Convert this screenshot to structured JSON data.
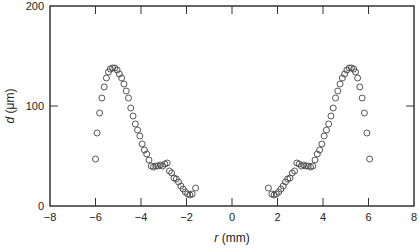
{
  "chart_data": {
    "type": "scatter",
    "title": "",
    "xlabel": "r (mm)",
    "ylabel": "d (μm)",
    "xlim": [
      -8,
      8
    ],
    "ylim": [
      0,
      200
    ],
    "xticks": [
      -8,
      -6,
      -4,
      -2,
      0,
      2,
      4,
      6,
      8
    ],
    "yticks": [
      0,
      100,
      200
    ],
    "xtick_labels": [
      "−8",
      "−6",
      "−4",
      "−2",
      "0",
      "2",
      "4",
      "6",
      "8"
    ],
    "ytick_labels": [
      "0",
      "100",
      "200"
    ],
    "grid": false,
    "legend": null,
    "marker": "open-circle",
    "series": [
      {
        "name": "left",
        "x": [
          -6.0,
          -5.93,
          -5.82,
          -5.72,
          -5.62,
          -5.52,
          -5.43,
          -5.35,
          -5.25,
          -5.15,
          -5.05,
          -4.95,
          -4.85,
          -4.75,
          -4.65,
          -4.55,
          -4.45,
          -4.35,
          -4.25,
          -4.15,
          -4.05,
          -3.95,
          -3.85,
          -3.75,
          -3.65,
          -3.55,
          -3.45,
          -3.35,
          -3.25,
          -3.15,
          -3.05,
          -2.95,
          -2.85,
          -2.75,
          -2.65,
          -2.55,
          -2.45,
          -2.35,
          -2.25,
          -2.15,
          -2.05,
          -1.95,
          -1.85,
          -1.75,
          -1.6
        ],
        "y": [
          47,
          73,
          93,
          108,
          119,
          128,
          134,
          137,
          138,
          138,
          136,
          132,
          128,
          122,
          115,
          108,
          98,
          90,
          82,
          76,
          70,
          62,
          56,
          52,
          46,
          40,
          39,
          40,
          40,
          41,
          40,
          42,
          43,
          35,
          33,
          28,
          27,
          24,
          20,
          17,
          14,
          12,
          11,
          12,
          18
        ]
      },
      {
        "name": "right",
        "x": [
          1.6,
          1.75,
          1.85,
          1.95,
          2.05,
          2.15,
          2.25,
          2.35,
          2.45,
          2.55,
          2.65,
          2.75,
          2.85,
          2.95,
          3.05,
          3.15,
          3.25,
          3.35,
          3.45,
          3.55,
          3.65,
          3.75,
          3.85,
          3.95,
          4.05,
          4.15,
          4.25,
          4.35,
          4.45,
          4.55,
          4.65,
          4.75,
          4.85,
          4.95,
          5.05,
          5.15,
          5.25,
          5.35,
          5.43,
          5.52,
          5.62,
          5.72,
          5.82,
          5.93,
          6.05
        ],
        "y": [
          18,
          12,
          11,
          12,
          14,
          17,
          20,
          24,
          27,
          28,
          33,
          35,
          43,
          42,
          40,
          41,
          40,
          40,
          39,
          40,
          46,
          52,
          56,
          62,
          70,
          76,
          82,
          90,
          98,
          108,
          115,
          122,
          128,
          132,
          136,
          138,
          138,
          137,
          134,
          128,
          119,
          108,
          93,
          73,
          47
        ]
      }
    ]
  },
  "axes": {
    "xlabel_italic": "r",
    "xlabel_unit": " (mm)",
    "ylabel_italic": "d",
    "ylabel_unit": " (μm)"
  }
}
